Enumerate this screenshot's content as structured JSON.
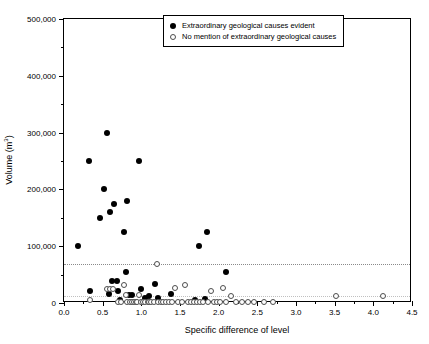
{
  "chart_data": {
    "type": "scatter",
    "title": "",
    "xlabel": "Specific difference of level",
    "ylabel": "Volume (m³)",
    "xlim": [
      0.0,
      4.5
    ],
    "ylim": [
      0,
      500000
    ],
    "xticks": [
      "0.0",
      "0.5",
      "1.0",
      "1.5",
      "2.0",
      "2.5",
      "3.0",
      "3.5",
      "4.0",
      "4.5"
    ],
    "xtick_values": [
      0.0,
      0.5,
      1.0,
      1.5,
      2.0,
      2.5,
      3.0,
      3.5,
      4.0,
      4.5
    ],
    "yticks": [
      "0",
      "100,000",
      "200,000",
      "300,000",
      "400,000",
      "500,000"
    ],
    "ytick_values": [
      0,
      100000,
      200000,
      300000,
      400000,
      500000
    ],
    "grid": false,
    "legend_position": "top-center",
    "reference_lines": [
      {
        "orientation": "horizontal",
        "value": 68000,
        "style": "dotted",
        "color": "#8a8a8a"
      },
      {
        "orientation": "horizontal",
        "value": 12000,
        "style": "dotted",
        "color": "#c0c0c0"
      }
    ],
    "series": [
      {
        "name": "Extraordinary geological causes evident",
        "marker": "filled-circle",
        "color": "#000000",
        "points": [
          [
            0.18,
            100000
          ],
          [
            0.32,
            250000
          ],
          [
            0.33,
            22000
          ],
          [
            0.46,
            150000
          ],
          [
            0.52,
            200000
          ],
          [
            0.55,
            300000
          ],
          [
            0.58,
            15000
          ],
          [
            0.6,
            160000
          ],
          [
            0.62,
            38000
          ],
          [
            0.65,
            175000
          ],
          [
            0.68,
            38000
          ],
          [
            0.7,
            22000
          ],
          [
            0.72,
            5000
          ],
          [
            0.78,
            125000
          ],
          [
            0.8,
            55000
          ],
          [
            0.82,
            180000
          ],
          [
            0.84,
            14000
          ],
          [
            0.88,
            14000
          ],
          [
            0.97,
            250000
          ],
          [
            1.0,
            25000
          ],
          [
            1.05,
            9000
          ],
          [
            1.1,
            12000
          ],
          [
            1.18,
            33000
          ],
          [
            1.22,
            8000
          ],
          [
            1.38,
            16000
          ],
          [
            1.7,
            6000
          ],
          [
            1.75,
            100000
          ],
          [
            1.82,
            7000
          ],
          [
            1.85,
            125000
          ],
          [
            2.1,
            55000
          ]
        ]
      },
      {
        "name": "No mention of extraordinary geological causes",
        "marker": "open-circle",
        "color": "#4d4d4d",
        "points": [
          [
            0.33,
            5000
          ],
          [
            0.56,
            24000
          ],
          [
            0.6,
            24000
          ],
          [
            0.64,
            24000
          ],
          [
            0.7,
            2000
          ],
          [
            0.74,
            2000
          ],
          [
            0.78,
            32000
          ],
          [
            0.8,
            14000
          ],
          [
            0.82,
            2000
          ],
          [
            0.85,
            2000
          ],
          [
            0.88,
            2000
          ],
          [
            0.9,
            2000
          ],
          [
            0.93,
            2000
          ],
          [
            0.95,
            2000
          ],
          [
            0.97,
            14000
          ],
          [
            1.0,
            2000
          ],
          [
            1.02,
            2000
          ],
          [
            1.05,
            2000
          ],
          [
            1.08,
            2000
          ],
          [
            1.1,
            2000
          ],
          [
            1.13,
            2000
          ],
          [
            1.16,
            2000
          ],
          [
            1.2,
            68000
          ],
          [
            1.22,
            2000
          ],
          [
            1.25,
            2000
          ],
          [
            1.28,
            2000
          ],
          [
            1.32,
            2000
          ],
          [
            1.36,
            2000
          ],
          [
            1.4,
            2000
          ],
          [
            1.44,
            26000
          ],
          [
            1.48,
            2000
          ],
          [
            1.52,
            2000
          ],
          [
            1.56,
            32000
          ],
          [
            1.6,
            2000
          ],
          [
            1.64,
            2000
          ],
          [
            1.68,
            2000
          ],
          [
            1.72,
            2000
          ],
          [
            1.76,
            2000
          ],
          [
            1.8,
            2000
          ],
          [
            1.86,
            2000
          ],
          [
            1.9,
            22000
          ],
          [
            1.94,
            2000
          ],
          [
            1.98,
            2000
          ],
          [
            2.02,
            2000
          ],
          [
            2.06,
            26000
          ],
          [
            2.1,
            2000
          ],
          [
            2.16,
            12000
          ],
          [
            2.22,
            2000
          ],
          [
            2.3,
            2000
          ],
          [
            2.38,
            2000
          ],
          [
            2.46,
            2000
          ],
          [
            2.58,
            2000
          ],
          [
            2.7,
            2000
          ],
          [
            3.52,
            12000
          ],
          [
            4.12,
            12000
          ]
        ]
      }
    ]
  },
  "legend": {
    "entries": [
      {
        "label": "Extraordinary geological causes evident",
        "marker": "filled-circle"
      },
      {
        "label": "No mention of extraordinary geological causes",
        "marker": "open-circle"
      }
    ]
  }
}
